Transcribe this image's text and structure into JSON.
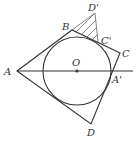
{
  "diagram": {
    "colors": {
      "stroke": "#333333",
      "background": "#ffffff"
    },
    "labels": {
      "A": "A",
      "B": "B",
      "C": "C",
      "D": "D",
      "O": "O",
      "A_prime": "A'",
      "C_prime": "C'",
      "D_prime": "D'"
    },
    "points": {
      "A": [
        17,
        71
      ],
      "B": [
        72,
        30
      ],
      "C": [
        120,
        53
      ],
      "D": [
        91,
        124
      ],
      "O": [
        77,
        71
      ],
      "A_prime": [
        112,
        71
      ],
      "C_prime": [
        98,
        42
      ],
      "D_prime": [
        95,
        13
      ]
    },
    "circle": {
      "center": "O",
      "radius": 34
    },
    "shaded_region": [
      "B",
      "D_prime",
      "C_prime"
    ]
  }
}
